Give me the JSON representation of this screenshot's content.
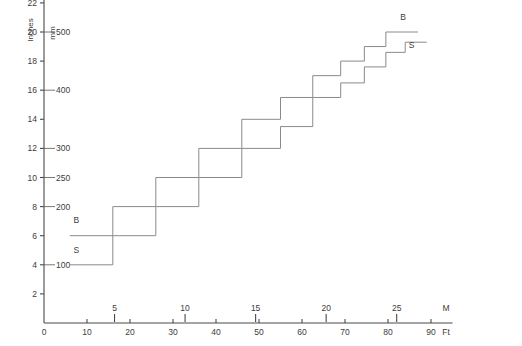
{
  "chart_data": {
    "type": "line",
    "title": "",
    "subtitle": "",
    "xlabel_primary": "Ft",
    "xlabel_secondary": "M",
    "ylabel_primary": "Inches",
    "ylabel_secondary": "mm",
    "grid": false,
    "legend_position": "inline-end-of-line",
    "xlim_ft": [
      0,
      95
    ],
    "ylim_in": [
      0,
      23.5
    ],
    "x_ticks_ft": [
      0,
      10,
      20,
      30,
      40,
      50,
      60,
      70,
      80,
      90
    ],
    "x_tick_labels_ft": [
      "0",
      "10",
      "20",
      "30",
      "40",
      "50",
      "60",
      "70",
      "80",
      "90"
    ],
    "x_ticks_m": [
      5,
      10,
      15,
      20,
      25
    ],
    "x_tick_labels_m": [
      "5",
      "10",
      "15",
      "20",
      "25"
    ],
    "y_ticks_in": [
      2,
      4,
      6,
      8,
      10,
      12,
      14,
      16,
      18,
      20,
      22
    ],
    "y_tick_labels_in": [
      "2",
      "4",
      "6",
      "8",
      "10",
      "12",
      "14",
      "16",
      "18",
      "20",
      "22"
    ],
    "y_ticks_mm": [
      {
        "inches": 4,
        "label": "100"
      },
      {
        "inches": 8,
        "label": "200"
      },
      {
        "inches": 10,
        "label": "250"
      },
      {
        "inches": 12,
        "label": "300"
      },
      {
        "inches": 16,
        "label": "400"
      },
      {
        "inches": 20,
        "label": "500"
      }
    ],
    "series": [
      {
        "name": "B",
        "label_start": "B",
        "label_end": "B",
        "units": {
          "x": "ft",
          "y": "in"
        },
        "points_ft_in": [
          [
            6,
            6
          ],
          [
            16,
            6
          ],
          [
            16,
            8
          ],
          [
            26,
            8
          ],
          [
            26,
            10
          ],
          [
            36,
            10
          ],
          [
            36,
            12
          ],
          [
            46,
            12
          ],
          [
            46,
            14
          ],
          [
            55,
            14
          ],
          [
            55,
            15.5
          ],
          [
            62.5,
            15.5
          ],
          [
            62.5,
            17
          ],
          [
            69,
            17
          ],
          [
            69,
            18
          ],
          [
            74.5,
            18
          ],
          [
            74.5,
            19
          ],
          [
            79.5,
            19
          ],
          [
            79.5,
            20
          ],
          [
            87,
            20
          ]
        ]
      },
      {
        "name": "S",
        "label_start": "S",
        "label_end": "S",
        "units": {
          "x": "ft",
          "y": "in"
        },
        "points_ft_in": [
          [
            6,
            4
          ],
          [
            16,
            4
          ],
          [
            16,
            6
          ],
          [
            26,
            6
          ],
          [
            26,
            8
          ],
          [
            36,
            8
          ],
          [
            36,
            10
          ],
          [
            46,
            10
          ],
          [
            46,
            12
          ],
          [
            55,
            12
          ],
          [
            55,
            13.5
          ],
          [
            62.5,
            13.5
          ],
          [
            62.5,
            15.5
          ],
          [
            69,
            15.5
          ],
          [
            69,
            16.5
          ],
          [
            74.5,
            16.5
          ],
          [
            74.5,
            17.6
          ],
          [
            79.5,
            17.6
          ],
          [
            79.5,
            18.6
          ],
          [
            84,
            18.6
          ],
          [
            84,
            19.3
          ],
          [
            89,
            19.3
          ]
        ]
      }
    ],
    "annotations": [
      {
        "text": "B",
        "x_ft": 7.5,
        "y_in": 6.9,
        "series": "B",
        "position": "start"
      },
      {
        "text": "S",
        "x_ft": 7.5,
        "y_in": 4.8,
        "series": "S",
        "position": "start"
      },
      {
        "text": "B",
        "x_ft": 83.5,
        "y_in": 20.8,
        "series": "B",
        "position": "end"
      },
      {
        "text": "S",
        "x_ft": 85.5,
        "y_in": 18.9,
        "series": "S",
        "position": "end"
      }
    ],
    "colors": {
      "background": "#ffffff",
      "axis": "#4a4a4a",
      "curve": "#8a8a8a",
      "text": "#3c3c3c"
    }
  }
}
